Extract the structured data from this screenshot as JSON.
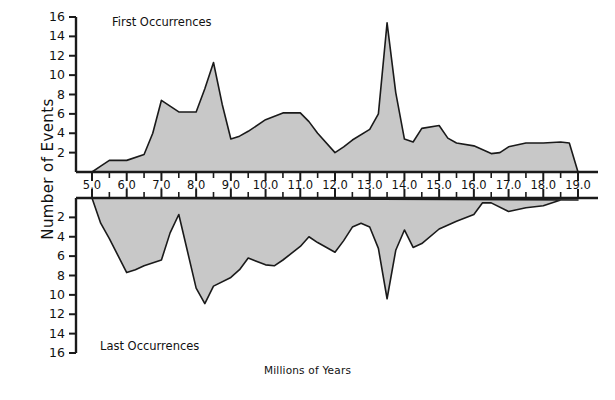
{
  "figure": {
    "axis_y_title": "Number of Events",
    "axis_x_title": "Millions of Years",
    "caption": "",
    "panel_top_label": "First Occurrences",
    "panel_bottom_label": "Last Occurrences",
    "line_color": "#1a1a1a",
    "fill_color": "#c8c8c8",
    "background_color": "#ffffff"
  },
  "chart_data": {
    "type": "area",
    "title": "",
    "xlabel": "Millions of Years",
    "ylabel": "Number of Events",
    "xlim": [
      5.0,
      19.5
    ],
    "grid": false,
    "legend_position": "inside-panel",
    "x_major_ticks": [
      5.0,
      6.0,
      7.0,
      8.0,
      9.0,
      10.0,
      11.0,
      12.0,
      13.0,
      14.0,
      15.0,
      16.0,
      17.0,
      18.0,
      19.0
    ],
    "x_major_tick_labels": [
      "5.0",
      "6.0",
      "7.0",
      "8.0",
      "9.0",
      "10.0",
      "11.0",
      "12.0",
      "13.0",
      "14.0",
      "15.0",
      "16.0",
      "17.0",
      "18.0",
      "19.0"
    ],
    "x_minor_tick_interval": 0.5,
    "panels": [
      {
        "name": "First Occurrences",
        "label": "First Occurrences",
        "direction": "up",
        "ylim": [
          0,
          16
        ],
        "y_ticks": [
          2,
          4,
          6,
          8,
          10,
          12,
          14,
          16
        ],
        "y_tick_labels": [
          "2",
          "4",
          "6",
          "8",
          "10",
          "12",
          "14",
          "16"
        ],
        "x": [
          5.0,
          5.25,
          5.5,
          6.0,
          6.5,
          6.75,
          7.0,
          7.25,
          7.5,
          8.0,
          8.25,
          8.5,
          8.75,
          9.0,
          9.25,
          9.5,
          10.0,
          10.5,
          11.0,
          11.25,
          11.5,
          12.0,
          12.25,
          12.5,
          13.0,
          13.25,
          13.5,
          13.75,
          14.0,
          14.25,
          14.5,
          15.0,
          15.25,
          15.5,
          16.0,
          16.5,
          16.75,
          17.0,
          17.5,
          18.0,
          18.5,
          18.75,
          19.0
        ],
        "y": [
          0,
          0.6,
          1.2,
          1.2,
          1.8,
          4.0,
          7.4,
          6.8,
          6.2,
          6.2,
          8.6,
          11.3,
          7.0,
          3.4,
          3.7,
          4.2,
          5.4,
          6.1,
          6.1,
          5.2,
          4.0,
          2.0,
          2.6,
          3.3,
          4.4,
          6.0,
          15.4,
          8.2,
          3.4,
          3.1,
          4.5,
          4.8,
          3.5,
          3.0,
          2.7,
          1.9,
          2.0,
          2.6,
          3.0,
          3.0,
          3.1,
          3.0,
          0
        ]
      },
      {
        "name": "Last Occurrences",
        "label": "Last Occurrences",
        "direction": "down",
        "ylim": [
          0,
          16
        ],
        "y_ticks": [
          2,
          4,
          6,
          8,
          10,
          12,
          14,
          16
        ],
        "y_tick_labels": [
          "2",
          "4",
          "6",
          "8",
          "10",
          "12",
          "14",
          "16"
        ],
        "x": [
          5.0,
          5.25,
          5.5,
          6.0,
          6.25,
          6.5,
          7.0,
          7.25,
          7.5,
          7.75,
          8.0,
          8.25,
          8.5,
          9.0,
          9.25,
          9.5,
          10.0,
          10.25,
          10.5,
          11.0,
          11.25,
          11.5,
          12.0,
          12.25,
          12.5,
          12.75,
          13.0,
          13.25,
          13.5,
          13.75,
          14.0,
          14.25,
          14.5,
          15.0,
          15.5,
          16.0,
          16.25,
          16.5,
          17.0,
          17.5,
          18.0,
          18.5,
          19.0
        ],
        "y": [
          0,
          2.6,
          4.2,
          7.7,
          7.4,
          7.0,
          6.4,
          3.6,
          1.7,
          5.5,
          9.3,
          10.9,
          9.1,
          8.2,
          7.4,
          6.2,
          6.9,
          7.0,
          6.4,
          5.0,
          4.0,
          4.6,
          5.6,
          4.4,
          3.0,
          2.6,
          3.0,
          5.2,
          10.4,
          5.4,
          3.3,
          5.1,
          4.7,
          3.2,
          2.4,
          1.7,
          0.5,
          0.5,
          1.4,
          1.0,
          0.8,
          0.2,
          0.2
        ]
      }
    ]
  }
}
